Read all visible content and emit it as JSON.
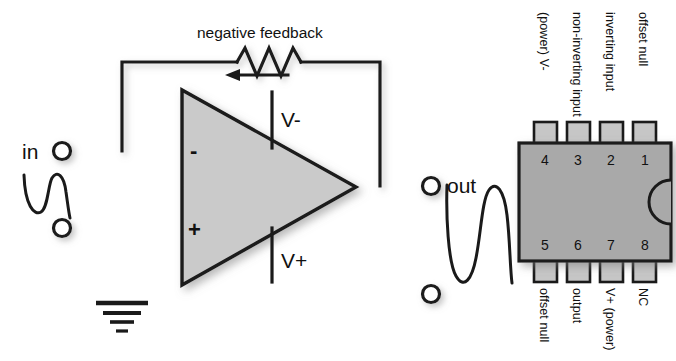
{
  "figure": {
    "colors": {
      "wire": "#1a1a1a",
      "amp_fill": "#cacaca",
      "chip_fill": "#a9a9a9",
      "pin_fill": "#c6c6c6",
      "background": "#ffffff"
    }
  },
  "schematic": {
    "feedback_label": "negative feedback",
    "input_label": "in",
    "output_label": "out",
    "inverting_sign": "-",
    "noninverting_sign": "+",
    "rail_negative": "V-",
    "rail_positive": "V+",
    "component_names": {
      "resistor": "feedback-resistor",
      "amplifier": "op-amp-triangle",
      "ground": "ground-symbol",
      "input_waveform": "input-sine-wave",
      "output_waveform": "output-sine-wave",
      "feedback_arrow": "feedback-direction-arrow"
    }
  },
  "chip": {
    "package_name": "8-pin DIP",
    "top_pins": [
      {
        "number": "4",
        "label": "(power) V-"
      },
      {
        "number": "3",
        "label": "non-inverting input"
      },
      {
        "number": "2",
        "label": "inverting input"
      },
      {
        "number": "1",
        "label": "offset null"
      }
    ],
    "bottom_pins": [
      {
        "number": "5",
        "label": "offset null"
      },
      {
        "number": "6",
        "label": "output"
      },
      {
        "number": "7",
        "label": "V+ (power)"
      },
      {
        "number": "8",
        "label": "NC"
      }
    ]
  }
}
